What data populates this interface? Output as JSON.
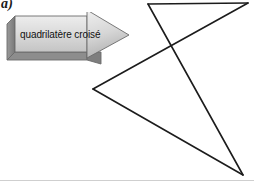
{
  "figure": {
    "label": "a)",
    "caption_arrow_text": "quadrilatère croisé"
  },
  "colors": {
    "stroke": "#1c1c1c",
    "arrow_face_light": "#e4e4e4",
    "arrow_face_mid": "#c9c9c9",
    "arrow_face_dark": "#8f8f8f",
    "arrow_side_dark": "#7d7d7d",
    "arrow_outline": "#6b6b6b",
    "background": "#ffffff",
    "rule": "#cfcfcf"
  },
  "chart_data": {
    "type": "diagram",
    "title": "quadrilatère croisé",
    "shape": "crossed-quadrilateral",
    "vertices": [
      {
        "name": "A",
        "x": 148,
        "y": 4
      },
      {
        "name": "B",
        "x": 248,
        "y": 3
      },
      {
        "name": "C",
        "x": 93,
        "y": 89
      },
      {
        "name": "D",
        "x": 243,
        "y": 175
      }
    ],
    "edges": [
      {
        "from": "A",
        "to": "B"
      },
      {
        "from": "B",
        "to": "C"
      },
      {
        "from": "C",
        "to": "D"
      },
      {
        "from": "D",
        "to": "A"
      }
    ],
    "intersection_point": {
      "x": 172,
      "y": 46
    },
    "stroke_width": 1.6,
    "fill": "none",
    "grid": false,
    "legend": false
  },
  "annotation": {
    "arrow_direction": "right",
    "arrow_style": "3d-block-arrow"
  }
}
